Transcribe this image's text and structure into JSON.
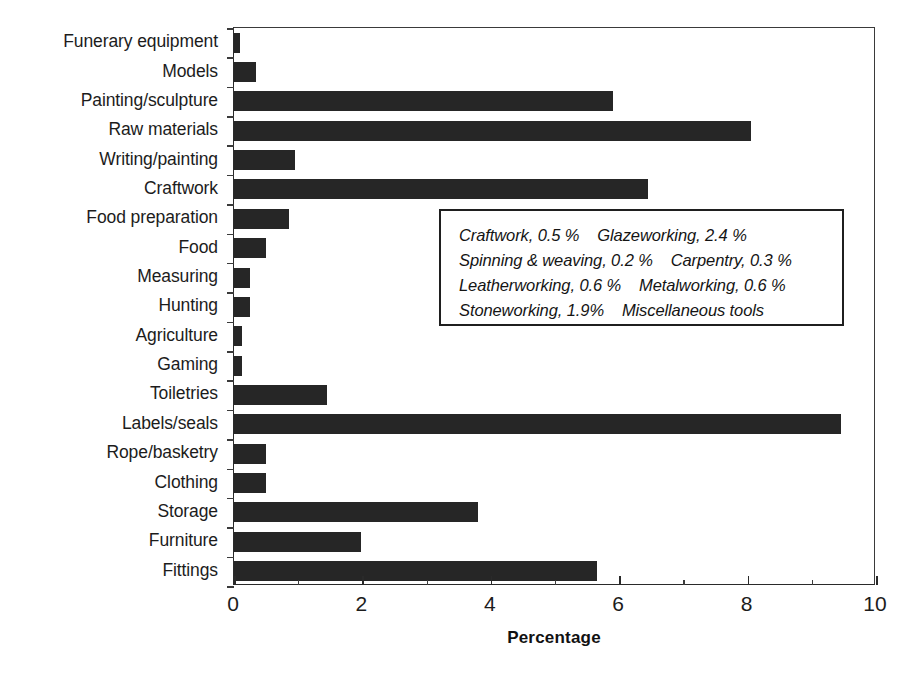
{
  "chart_data": {
    "type": "bar",
    "orientation": "horizontal",
    "title": "",
    "xlabel": "Percentage",
    "ylabel": "",
    "xlim": [
      0,
      10
    ],
    "ylim": null,
    "grid": false,
    "legend_position": "inside-right",
    "bar_color": "#262626",
    "x_ticks": [
      "0",
      "2",
      "4",
      "6",
      "8",
      "10"
    ],
    "x_tick_values": [
      0,
      2,
      4,
      6,
      8,
      10
    ],
    "x_minor_tick_step": 1,
    "categories": [
      "Funerary equipment",
      "Models",
      "Painting/sculpture",
      "Raw materials",
      "Writing/painting",
      "Craftwork",
      "Food preparation",
      "Food",
      "Measuring",
      "Hunting",
      "Agriculture",
      "Gaming",
      "Toiletries",
      "Labels/seals",
      "Rope/basketry",
      "Clothing",
      "Storage",
      "Furniture",
      "Fittings"
    ],
    "values": [
      0.1,
      0.35,
      5.9,
      8.05,
      0.95,
      6.45,
      0.85,
      0.5,
      0.25,
      0.25,
      0.12,
      0.12,
      1.45,
      9.45,
      0.5,
      0.5,
      3.8,
      1.98,
      5.65
    ],
    "annotations": {
      "box_title": "",
      "lines": [
        "Craftwork, 0.5 %    Glazeworking, 2.4 %",
        "Spinning & weaving, 0.2 %    Carpentry, 0.3 %",
        "Leatherworking, 0.6 %    Metalworking, 0.6 %",
        "Stoneworking, 1.9%    Miscellaneous tools"
      ],
      "entries": [
        {
          "label": "Craftwork",
          "value": "0.5 %"
        },
        {
          "label": "Glazeworking",
          "value": "2.4 %"
        },
        {
          "label": "Spinning & weaving",
          "value": "0.2 %"
        },
        {
          "label": "Carpentry",
          "value": "0.3 %"
        },
        {
          "label": "Leatherworking",
          "value": "0.6 %"
        },
        {
          "label": "Metalworking",
          "value": "0.6 %"
        },
        {
          "label": "Stoneworking",
          "value": "1.9%"
        },
        {
          "label": "Miscellaneous tools",
          "value": ""
        }
      ]
    }
  }
}
